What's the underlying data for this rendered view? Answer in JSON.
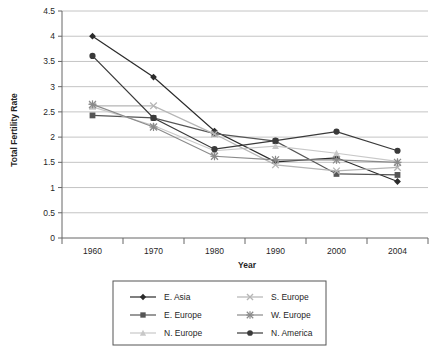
{
  "chart_data": {
    "type": "line",
    "title": "",
    "xlabel": "Year",
    "ylabel": "Total Fertility Rate",
    "categories": [
      "1960",
      "1970",
      "1980",
      "1990",
      "2000",
      "2004"
    ],
    "x": [
      1960,
      1970,
      1980,
      1990,
      2000,
      2004
    ],
    "ylim": [
      0,
      4.5
    ],
    "ytick_labels": [
      "0",
      "0.5",
      "1",
      "1.5",
      "2",
      "2.5",
      "3",
      "3.5",
      "4",
      "4.5"
    ],
    "ytick_values": [
      0,
      0.5,
      1,
      1.5,
      2,
      2.5,
      3,
      3.5,
      4,
      4.5
    ],
    "grid": "horizontal",
    "legend_position": "bottom",
    "series": [
      {
        "name": "E. Asia",
        "marker": "diamond",
        "color": "#2b2b2b",
        "values": [
          4.0,
          3.19,
          2.12,
          1.51,
          1.59,
          1.12
        ]
      },
      {
        "name": "E. Europe",
        "marker": "square",
        "color": "#555555",
        "values": [
          2.43,
          2.38,
          2.07,
          1.92,
          1.27,
          1.25
        ]
      },
      {
        "name": "N. Europe",
        "marker": "triangle",
        "color": "#c8c8c8",
        "values": [
          2.6,
          2.23,
          1.73,
          1.82,
          1.68,
          1.52
        ]
      },
      {
        "name": "S. Europe",
        "marker": "x",
        "color": "#b5b5b5",
        "values": [
          2.62,
          2.62,
          2.06,
          1.45,
          1.33,
          1.4
        ]
      },
      {
        "name": "W. Europe",
        "marker": "asterisk",
        "color": "#8a8a8a",
        "values": [
          2.65,
          2.2,
          1.62,
          1.55,
          1.55,
          1.5
        ]
      },
      {
        "name": "N. America",
        "marker": "circle",
        "color": "#3a3a3a",
        "values": [
          3.61,
          2.38,
          1.76,
          1.93,
          2.11,
          1.73
        ]
      }
    ]
  },
  "axes": {
    "y_title": "Total Fertility Rate",
    "x_title": "Year"
  },
  "legend": {
    "items": [
      {
        "label": "E. Asia"
      },
      {
        "label": "S. Europe"
      },
      {
        "label": "E. Europe"
      },
      {
        "label": "W. Europe"
      },
      {
        "label": "N. Europe"
      },
      {
        "label": "N. America"
      }
    ]
  },
  "colors": {
    "axis": "#666666",
    "grid": "#c4c4c4",
    "background": "#ffffff",
    "legend_border": "#555555"
  }
}
